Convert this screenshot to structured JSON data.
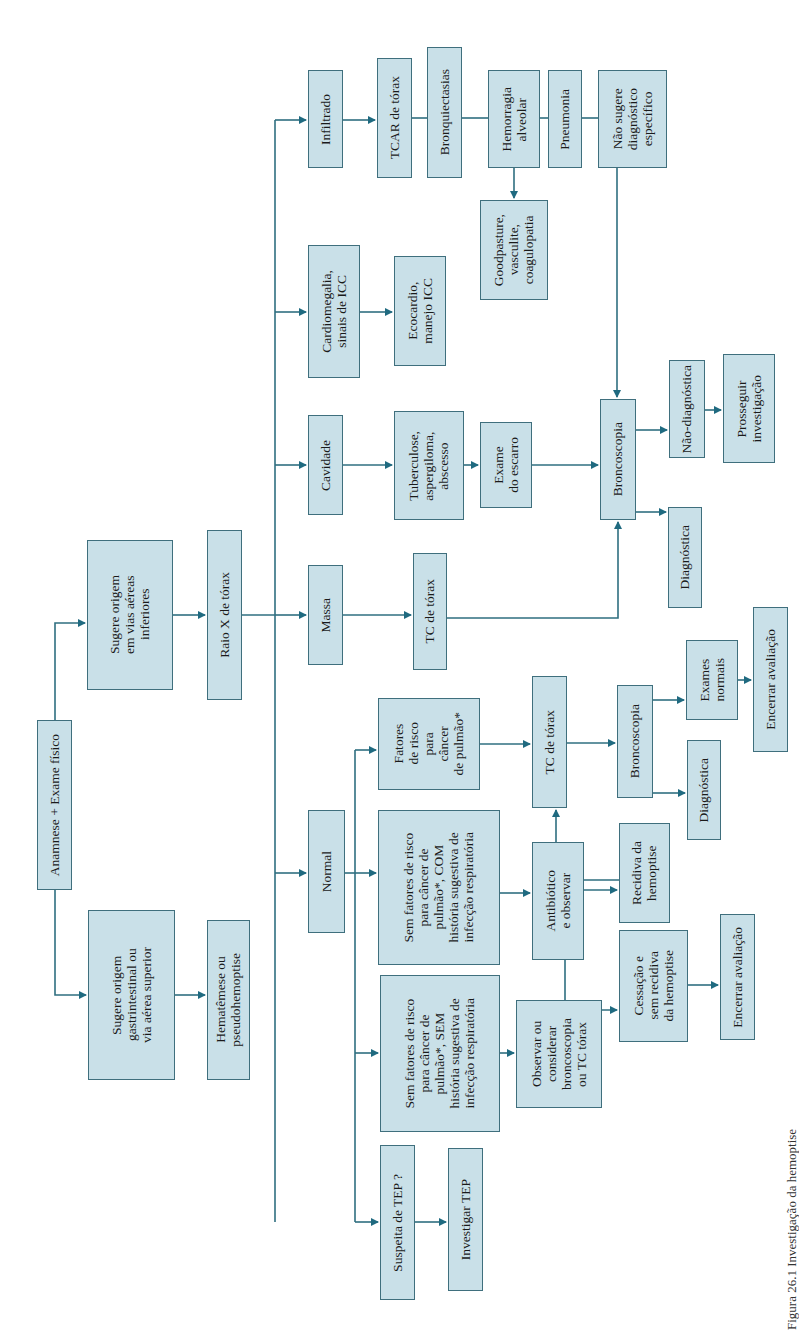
{
  "colors": {
    "box_fill": "#c9e0e8",
    "box_border": "#3f6f7d",
    "arrow": "#1f6a80"
  },
  "caption": "Figura 26.1 Investigação da hemoptise",
  "nodes": {
    "anamnese": "Anamnese + Exame físico",
    "vias_inferiores": "Sugere origem\nem vias aéreas\ninferiores",
    "gastro": "Sugere origem\ngastrintestinal ou\nvia aérea superior",
    "hematemese": "Hematêmese ou\npseudohemoptise",
    "raio_x": "Raio X de tórax",
    "massa": "Massa",
    "cavidade": "Cavidade",
    "cardiomegalia": "Cardiomegalia,\nsinais de ICC",
    "infiltrado": "Infiltrado",
    "tcar": "TCAR de tórax",
    "bronquiectasias": "Bronquiectasias",
    "hemorragia": "Hemorragia\nalveolar",
    "pneumonia": "Pneumonia",
    "nao_sugere": "Não sugere\ndiagnóstico\nespecífico",
    "goodpasture": "Goodpasture,\nvasculite,\ncoagulopatia",
    "ecocardio": "Ecocardio,\nmanejo ICC",
    "tuberculose": "Tuberculose,\naspergiloma,\nabscesso",
    "escarro": "Exame\ndo escarro",
    "broncoscopia_1": "Broncoscopia",
    "nao_diagnostica": "Não-diagnóstica",
    "prosseguir": "Prosseguir\ninvestigação",
    "diagnostica_1": "Diagnóstica",
    "tc_torax_1": "TC de tórax",
    "normal": "Normal",
    "fatores_risco": "Fatores\nde risco\npara\ncâncer\nde pulmão*",
    "sem_com": "Sem fatores de risco\npara câncer de\npulmão*, COM\nhistória sugestiva de\ninfecção respiratória",
    "sem_sem": "Sem fatores de risco\npara câncer  de\npulmão*, SEM\nhistória sugestiva de\ninfecção respiratória",
    "suspeita_tep": "Suspeita de TEP ?",
    "investigar_tep": "Investigar TEP",
    "observar": "Observar ou\nconsiderar\nbroncoscopia\nou TC tórax",
    "tc_torax_2": "TC  de  tórax",
    "antibiotico": "Antibiótico\ne observar",
    "recidiva": "Recidiva da\nhemoptise",
    "cessacao": "Cessação e\nsem recidiva\nda hemoptise",
    "encerrar_1": "Encerrar avaliação",
    "broncoscopia_2": "Broncoscopia",
    "diagnostica_2": "Diagnóstica",
    "exames_normais": "Exames\nnormais",
    "encerrar_2": "Encerrar avaliação"
  }
}
